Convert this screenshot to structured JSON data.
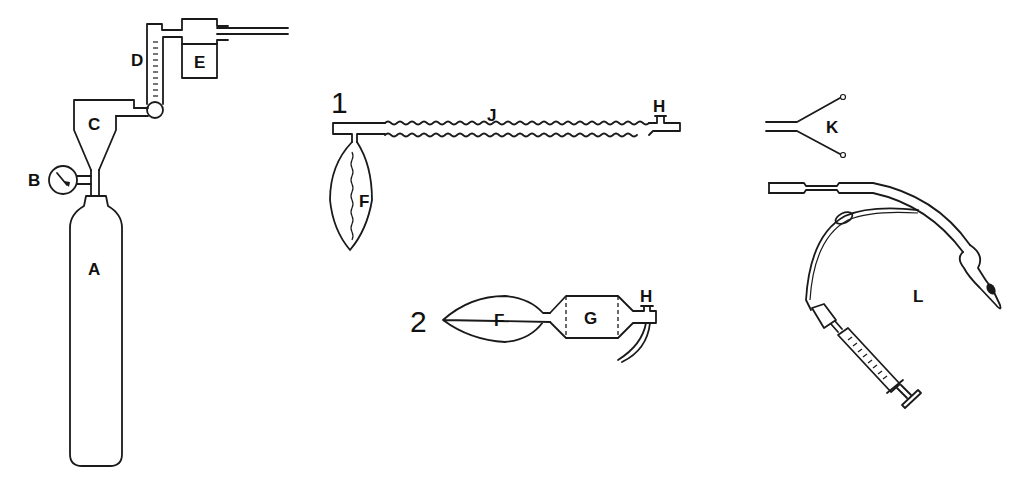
{
  "diagram": {
    "type": "anaesthesia-equipment-line-drawing",
    "colors": {
      "line": "#1a1a1a",
      "background": "#ffffff"
    },
    "components": {
      "A": {
        "label": "A",
        "depicts": "gas cylinder"
      },
      "B": {
        "label": "B",
        "depicts": "pressure gauge"
      },
      "C": {
        "label": "C",
        "depicts": "pressure regulator"
      },
      "D": {
        "label": "D",
        "depicts": "flowmeter"
      },
      "E": {
        "label": "E",
        "depicts": "vaporizer / humidifier"
      },
      "F1": {
        "label": "F",
        "depicts": "reservoir bag (circuit 1)"
      },
      "J": {
        "label": "J",
        "depicts": "corrugated breathing tube"
      },
      "H1": {
        "label": "H",
        "depicts": "fresh gas inlet (circuit 1)"
      },
      "F2": {
        "label": "F",
        "depicts": "self-inflating bag (circuit 2)"
      },
      "G": {
        "label": "G",
        "depicts": "valve housing"
      },
      "H2": {
        "label": "H",
        "depicts": "gas inlet with tubing (circuit 2)"
      },
      "K": {
        "label": "K",
        "depicts": "Y-piece connector"
      },
      "L": {
        "label": "L",
        "depicts": "cuffed endotracheal tube with syringe"
      }
    },
    "circuits": [
      {
        "number": "1"
      },
      {
        "number": "2"
      }
    ]
  }
}
